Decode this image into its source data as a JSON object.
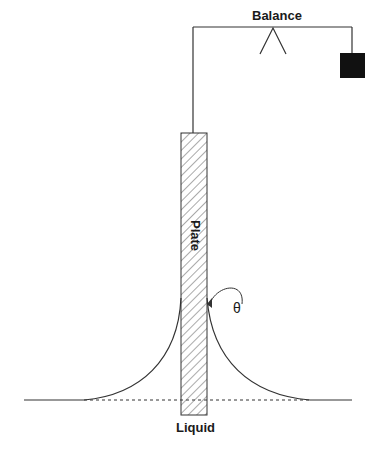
{
  "diagram": {
    "labels": {
      "balance": "Balance",
      "plate": "Plate",
      "liquid": "Liquid",
      "angle": "θ"
    },
    "colors": {
      "line": "#333333",
      "weight": "#111111",
      "background": "#ffffff"
    }
  }
}
